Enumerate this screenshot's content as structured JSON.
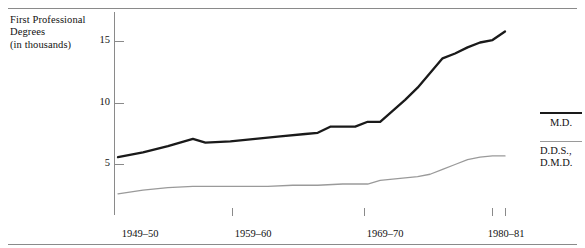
{
  "chart_data": {
    "type": "line",
    "title": "",
    "ylabel": "First Professional\nDegrees\n(in thousands)",
    "ylabel_lines": [
      "First Professional",
      "Degrees",
      "(in thousands)"
    ],
    "xlabel": "",
    "ylim": [
      0,
      17
    ],
    "yticks": [
      5,
      10,
      15
    ],
    "ytick_labels": [
      "5",
      "10",
      "15"
    ],
    "xticks": [
      "1949-50",
      "1959-60",
      "1969-70",
      "1980-81"
    ],
    "xtick_labels": [
      "1949–50",
      "1959–60",
      "1969–70",
      "1980–81"
    ],
    "grid": false,
    "legend_position": "right",
    "series": [
      {
        "name": "M.D.",
        "color": "#1a1a1a",
        "width": 2.3,
        "x": [
          1949,
          1951,
          1953,
          1955,
          1956,
          1958,
          1960,
          1962,
          1964,
          1965,
          1966,
          1967,
          1968,
          1969,
          1970,
          1971,
          1972,
          1973,
          1974,
          1975,
          1976,
          1977,
          1978,
          1979,
          1980
        ],
        "values": [
          5.6,
          6.0,
          6.5,
          7.1,
          6.8,
          6.9,
          7.1,
          7.3,
          7.5,
          7.6,
          8.1,
          8.1,
          8.1,
          8.5,
          8.5,
          9.4,
          10.3,
          11.3,
          12.5,
          13.7,
          14.1,
          14.6,
          15.0,
          15.2,
          15.9
        ]
      },
      {
        "name": "D.D.S., D.M.D.",
        "color": "#9a9a9a",
        "width": 1.3,
        "x": [
          1949,
          1951,
          1953,
          1955,
          1957,
          1959,
          1961,
          1963,
          1965,
          1967,
          1969,
          1970,
          1971,
          1972,
          1973,
          1974,
          1975,
          1976,
          1977,
          1978,
          1979,
          1980
        ],
        "values": [
          2.6,
          2.9,
          3.1,
          3.2,
          3.2,
          3.2,
          3.2,
          3.3,
          3.3,
          3.4,
          3.4,
          3.7,
          3.8,
          3.9,
          4.0,
          4.2,
          4.6,
          5.0,
          5.4,
          5.6,
          5.7,
          5.7
        ]
      }
    ],
    "legend_entries": [
      {
        "label": "M.D.",
        "label_lines": [
          "M.D."
        ],
        "color": "#1a1a1a",
        "width": 2.3
      },
      {
        "label": "D.D.S., D.M.D.",
        "label_lines": [
          "D.D.S.,",
          "D.M.D."
        ],
        "color": "#9a9a9a",
        "width": 1.3
      }
    ],
    "colors": {
      "axis": "#8a8a8a",
      "text": "#111111",
      "rule": "#8a8a8a",
      "background": "#ffffff"
    }
  }
}
